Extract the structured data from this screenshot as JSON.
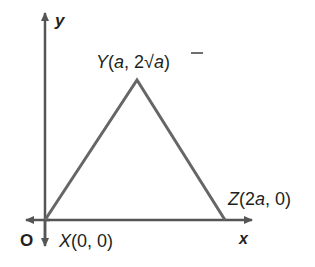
{
  "figure": {
    "axes": {
      "x_label": "x",
      "y_label": "y",
      "origin_label": "O"
    },
    "vertices": {
      "X": {
        "name": "X",
        "coords": "(0, 0)"
      },
      "Y": {
        "name": "Y",
        "coords_prefix": "(",
        "coords_a": "a",
        "coords_sep": ", 2",
        "coords_rad": "a",
        "coords_suffix": ")"
      },
      "Z": {
        "name": "Z",
        "coords_prefix": "(2",
        "coords_a": "a",
        "coords_suffix": ", 0)"
      }
    },
    "colors": {
      "triangle": "#666666",
      "axes": "#555555",
      "text": "#231f20"
    }
  }
}
